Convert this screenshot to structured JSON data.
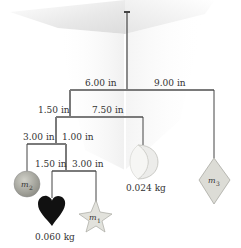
{
  "figure": {
    "rod_color": "#7a7a7a",
    "string_color": "#444444",
    "top_rod": {
      "left_arm_label": "6.00 in",
      "right_arm_label": "9.00 in"
    },
    "second_rod": {
      "left_arm_label": "1.50 in",
      "right_arm_label": "7.50 in"
    },
    "third_rod": {
      "left_arm_label": "3.00 in",
      "right_arm_label": "1.00 in"
    },
    "fourth_rod": {
      "left_arm_label": "1.50 in",
      "right_arm_label": "3.00 in"
    },
    "masses": {
      "sphere": {
        "label": "m",
        "subscript": "2",
        "color": "#a8a8a0"
      },
      "heart": {
        "mass_label": "0.060 kg",
        "color": "#111111"
      },
      "star": {
        "label": "m",
        "subscript": "1",
        "color": "#e2e2dc"
      },
      "moon": {
        "mass_label": "0.024 kg",
        "color": "#ececea"
      },
      "diamond": {
        "label": "m",
        "subscript": "3",
        "color": "#dcdcd6"
      }
    }
  }
}
